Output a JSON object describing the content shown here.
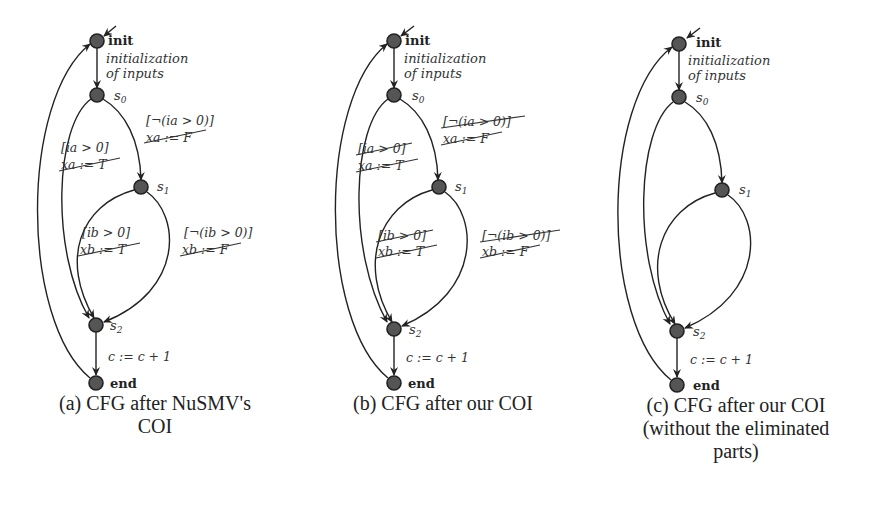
{
  "figure": {
    "panels": [
      {
        "id": "a",
        "caption_line1": "(a) CFG after NuSMV's",
        "caption_line2": "COI",
        "nodes": {
          "init": "init",
          "s0": "s",
          "s0_sub": "0",
          "s1": "s",
          "s1_sub": "1",
          "s2": "s",
          "s2_sub": "2",
          "end": "end"
        },
        "init_edge_label_1": "initialization",
        "init_edge_label_2": "of inputs",
        "s0_true_guard": "[ia > 0]",
        "s0_true_assign": "xa := T",
        "s0_false_guard": "[¬(ia > 0)]",
        "s0_false_assign": "xa := F",
        "s1_true_guard": "[ib > 0]",
        "s1_true_assign": "xb := T",
        "s1_false_guard": "[¬(ib > 0)]",
        "s1_false_assign": "xb := F",
        "s2_edge_label": "c := c + 1",
        "struck_guards": false,
        "struck_assigns": true
      },
      {
        "id": "b",
        "caption_line1": "(b) CFG after our COI",
        "nodes": {
          "init": "init",
          "s0": "s",
          "s0_sub": "0",
          "s1": "s",
          "s1_sub": "1",
          "s2": "s",
          "s2_sub": "2",
          "end": "end"
        },
        "init_edge_label_1": "initialization",
        "init_edge_label_2": "of inputs",
        "s0_true_guard": "[ia > 0]",
        "s0_true_assign": "xa := T",
        "s0_false_guard": "[¬(ia > 0)]",
        "s0_false_assign": "xa := F",
        "s1_true_guard": "[ib > 0]",
        "s1_true_assign": "xb := T",
        "s1_false_guard": "[¬(ib > 0)]",
        "s1_false_assign": "xb := F",
        "s2_edge_label": "c := c + 1",
        "struck_guards": true,
        "struck_assigns": true
      },
      {
        "id": "c",
        "caption_line1": "(c) CFG after our COI",
        "caption_line2": "(without the eliminated",
        "caption_line3": "parts)",
        "nodes": {
          "init": "init",
          "s0": "s",
          "s0_sub": "0",
          "s1": "s",
          "s1_sub": "1",
          "s2": "s",
          "s2_sub": "2",
          "end": "end"
        },
        "init_edge_label_1": "initialization",
        "init_edge_label_2": "of inputs",
        "s2_edge_label": "c := c + 1"
      }
    ]
  }
}
